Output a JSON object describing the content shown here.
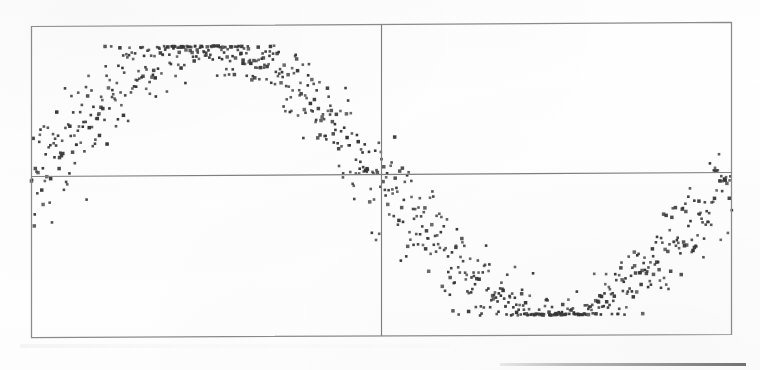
{
  "figure": {
    "title": "",
    "caption": "",
    "background_color": "#fefefe",
    "frame_color": "#8a8a8a",
    "axis_line_color": "#7e7e7e",
    "marker_color": "#363636"
  },
  "chart_data": {
    "type": "scatter",
    "title": "",
    "subtitle": "",
    "xlabel": "",
    "ylabel": "",
    "xticklabels": [],
    "yticklabels": [],
    "legend": [],
    "legend_position": "none",
    "grid": false,
    "annotations": [],
    "description": "Dense scatter of a single noisy sinusoid spanning one full period across the plot box; points are clipped flat against the top frame near the crest and against the bottom frame near the trough.",
    "xlim": [
      0,
      6.2832
    ],
    "ylim": [
      -1.15,
      1.15
    ],
    "axis_lines": {
      "horizontal_zero": 0,
      "vertical_mid": 3.1416
    },
    "series": [
      {
        "name": "noisy sine",
        "marker": "square",
        "marker_size_px": 2.6,
        "color": "#363636",
        "n_points": 820,
        "model": {
          "function": "y = sin(x) + noise",
          "amplitude": 1.0,
          "period": 6.2832,
          "phase": 0.0,
          "noise_type": "gaussian",
          "noise_sigma_base": 0.075,
          "noise_sigma_slope_gain": 0.105,
          "clip_low": -1.0,
          "clip_high": 1.0
        }
      }
    ]
  },
  "artifacts": {
    "scan_line_bottom_right": "faint horizontal rule, lower-right",
    "scan_smudge_bottom_left": "faint horizontal smudge beneath plot"
  }
}
